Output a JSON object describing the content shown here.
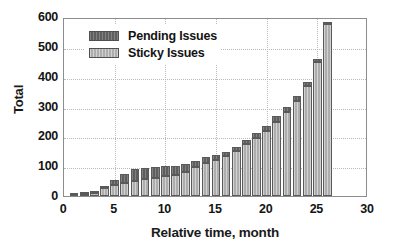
{
  "chart_data": {
    "type": "bar",
    "subtype": "stacked-bar",
    "title": "",
    "xlabel": "Relative time, month",
    "ylabel": "Total",
    "xlim": [
      0,
      30
    ],
    "ylim": [
      0,
      600
    ],
    "xticks": [
      0,
      5,
      10,
      15,
      20,
      25,
      30
    ],
    "yticks": [
      0,
      100,
      200,
      300,
      400,
      500,
      600
    ],
    "grid": true,
    "legend_position": "top-left",
    "x": [
      1,
      2,
      3,
      4,
      5,
      6,
      7,
      8,
      9,
      10,
      11,
      12,
      13,
      14,
      15,
      16,
      17,
      18,
      19,
      20,
      21,
      22,
      23,
      24,
      25,
      26
    ],
    "categories": [
      "1",
      "2",
      "3",
      "4",
      "5",
      "6",
      "7",
      "8",
      "9",
      "10",
      "11",
      "12",
      "13",
      "14",
      "15",
      "16",
      "17",
      "18",
      "19",
      "20",
      "21",
      "22",
      "23",
      "24",
      "25",
      "26"
    ],
    "series": [
      {
        "name": "Sticky Issues",
        "color": "#adadad",
        "values": [
          3,
          6,
          9,
          28,
          36,
          45,
          52,
          58,
          62,
          66,
          70,
          80,
          97,
          112,
          122,
          133,
          150,
          175,
          195,
          218,
          248,
          280,
          320,
          370,
          450,
          575
        ]
      },
      {
        "name": "Pending Issues",
        "color": "#5e5e5e",
        "values": [
          2,
          4,
          5,
          7,
          19,
          28,
          38,
          37,
          36,
          34,
          30,
          26,
          20,
          18,
          16,
          15,
          14,
          13,
          15,
          18,
          20,
          18,
          15,
          12,
          10,
          10
        ]
      }
    ],
    "totals": [
      5,
      10,
      14,
      35,
      55,
      73,
      90,
      95,
      98,
      100,
      100,
      106,
      117,
      130,
      138,
      148,
      164,
      188,
      210,
      236,
      268,
      298,
      335,
      382,
      460,
      585
    ]
  },
  "legend": {
    "items": [
      {
        "label": "Pending Issues",
        "swatch": "pending-swatch"
      },
      {
        "label": "Sticky Issues",
        "swatch": "sticky-swatch"
      }
    ]
  },
  "axes": {
    "y_label": "Total",
    "x_label": "Relative time, month",
    "y_tick_labels": [
      "600",
      "500",
      "400",
      "300",
      "200",
      "100",
      "0"
    ],
    "x_tick_labels": [
      "0",
      "5",
      "10",
      "15",
      "20",
      "25",
      "30"
    ]
  }
}
